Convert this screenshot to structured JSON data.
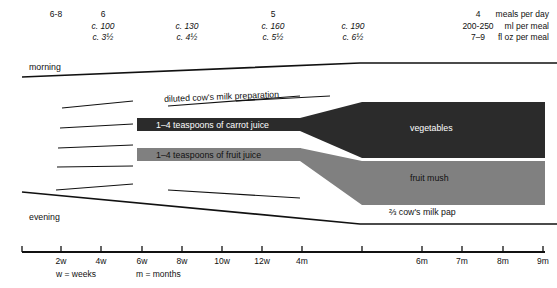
{
  "figure": {
    "type": "diagram",
    "title": ""
  },
  "header": {
    "columns": [
      {
        "x": 56,
        "meals": "6-8",
        "ml": "",
        "floz": ""
      },
      {
        "x": 103,
        "meals": "6",
        "ml": "c. 100",
        "floz": "c. 3½"
      },
      {
        "x": 187,
        "meals": "",
        "ml": "c. 130",
        "floz": "c. 4½"
      },
      {
        "x": 273,
        "meals": "5",
        "ml": "c. 160",
        "floz": "c. 5½"
      },
      {
        "x": 353,
        "meals": "",
        "ml": "c. 190",
        "floz": "c. 6½"
      },
      {
        "x": 478,
        "meals": "4",
        "ml": "200-250",
        "floz": "7–9"
      }
    ],
    "units": [
      "meals per day",
      "ml per meal",
      "fl oz per meal"
    ]
  },
  "chart_labels": {
    "morning": "morning",
    "evening": "evening",
    "milk_prep": "diluted cow's milk preparation",
    "carrot_juice": "1–4 teaspoons of carrot juice",
    "fruit_juice": "1–4 teaspoons of fruit juice",
    "vegetables": "vegetables",
    "fruit_mush": "fruit mush",
    "milk_pap": "⅔ cow's milk pap"
  },
  "axis": {
    "ticks": [
      {
        "x": 22,
        "label": ""
      },
      {
        "x": 61,
        "label": "2w"
      },
      {
        "x": 101,
        "label": "4w"
      },
      {
        "x": 142,
        "label": "6w"
      },
      {
        "x": 182,
        "label": "8w"
      },
      {
        "x": 222,
        "label": "10w"
      },
      {
        "x": 262,
        "label": "12w"
      },
      {
        "x": 302,
        "label": "4m"
      },
      {
        "x": 362,
        "label": ""
      },
      {
        "x": 422,
        "label": "6m"
      },
      {
        "x": 462,
        "label": "7m"
      },
      {
        "x": 503,
        "label": "8m"
      },
      {
        "x": 543,
        "label": "9m"
      }
    ],
    "notes": [
      {
        "x": 56,
        "text": "w = weeks"
      },
      {
        "x": 136,
        "text": "m = months"
      }
    ]
  },
  "colors": {
    "vegetables": "#2b2b2b",
    "fruit_mush": "#808080",
    "carrot_juice": "#2b2b2b",
    "fruit_juice": "#808080",
    "line": "#111111",
    "background": "#ffffff"
  }
}
